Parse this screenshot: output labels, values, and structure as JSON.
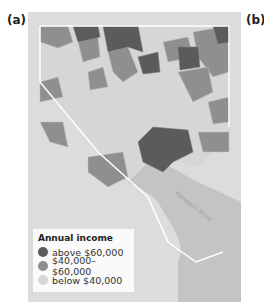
{
  "panels": {
    "a": "(a)",
    "b": "(b)"
  },
  "map": {
    "river_label": "Patapsco River",
    "colors": {
      "above": "#5b5b5b",
      "middle": "#8f8f8f",
      "below": "#d6d6d6",
      "water": "#c8c8c8",
      "frame": "#dcdcdc",
      "boundary": "#ffffff"
    }
  },
  "legend": {
    "title": "Annual income",
    "items": [
      {
        "label": "above $60,000",
        "color": "#5b5b5b"
      },
      {
        "label": "$40,000–$60,000",
        "color": "#8f8f8f"
      },
      {
        "label": "below  $40,000",
        "color": "#d6d6d6"
      }
    ]
  }
}
